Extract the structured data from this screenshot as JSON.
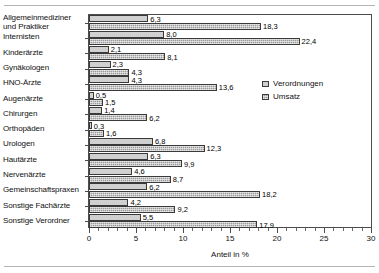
{
  "chart_data": {
    "type": "bar",
    "orientation": "horizontal",
    "title": "",
    "xlabel": "Anteil in %",
    "ylabel": "",
    "xlim": [
      0,
      30
    ],
    "xticks": [
      0,
      5,
      10,
      15,
      20,
      25,
      30
    ],
    "xtick_labels": [
      "0",
      "5",
      "10",
      "15",
      "20",
      "25",
      "30"
    ],
    "minor_tick_step": 1,
    "grid": false,
    "legend_position": "right-inside",
    "decimal_separator": ",",
    "categories": [
      "Allgemeinmediziner\nund Praktiker",
      "Internisten",
      "Kinderärzte",
      "Gynäkologen",
      "HNO-Ärzte",
      "Augenärzte",
      "Chirurgen",
      "Orthopäden",
      "Urologen",
      "Hautärzte",
      "Nervenärzte",
      "Gemeinschaftspraxen",
      "Sonstige Fachärzte",
      "Sonstige Verordner"
    ],
    "series": [
      {
        "name": "Verordnungen",
        "color": "#d0d0d0",
        "values": [
          6.3,
          8.0,
          2.1,
          2.3,
          4.3,
          0.5,
          1.4,
          0.3,
          6.8,
          6.3,
          4.6,
          6.2,
          4.2,
          5.5
        ],
        "labels": [
          "6,3",
          "8,0",
          "2,1",
          "2,3",
          "4,3",
          "0,5",
          "1,4",
          "0,3",
          "6,8",
          "6,3",
          "4,6",
          "6,2",
          "4,2",
          "5,5"
        ]
      },
      {
        "name": "Umsatz",
        "color": "#9a9a9a",
        "values": [
          18.3,
          22.4,
          8.1,
          4.3,
          13.6,
          1.5,
          6.2,
          1.6,
          12.3,
          9.9,
          8.7,
          18.2,
          9.2,
          17.9
        ],
        "labels": [
          "18,3",
          "22,4",
          "8,1",
          "4,3",
          "13,6",
          "1,5",
          "6,2",
          "1,6",
          "12,3",
          "9,9",
          "8,7",
          "18,2",
          "9,2",
          "17,9"
        ]
      }
    ]
  },
  "legend": {
    "items": [
      {
        "label": "Verordnungen",
        "key": "verordnungen"
      },
      {
        "label": "Umsatz",
        "key": "umsatz"
      }
    ]
  },
  "axis": {
    "x_title": "Anteil in %"
  }
}
